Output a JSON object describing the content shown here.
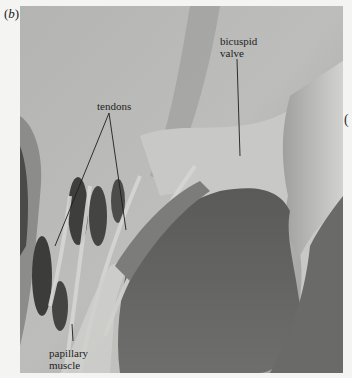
{
  "figure": {
    "panel_label_open": "(",
    "panel_label_letter": "b",
    "panel_label_close": ")",
    "edge_glyph": "(",
    "image_description": "grayscale micrograph of heart interior showing bicuspid valve, tendons and papillary muscle",
    "labels": {
      "bicuspid_line1": "bicuspid",
      "bicuspid_line2": "valve",
      "tendons": "tendons",
      "papillary_line1": "papillary",
      "papillary_line2": "muscle"
    }
  }
}
